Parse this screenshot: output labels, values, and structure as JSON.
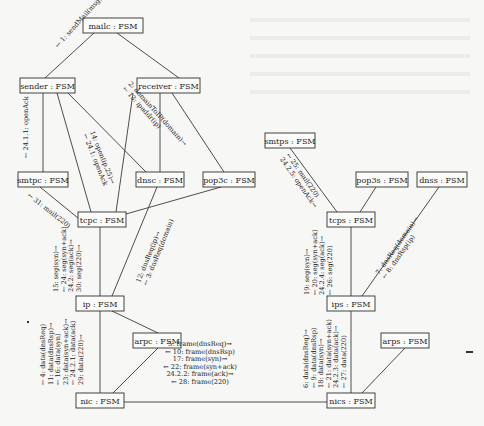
{
  "diagram": {
    "type": "uml-communication-diagram",
    "nodes": [
      {
        "id": "mailc",
        "label": "mailc : FSM",
        "x": 83,
        "y": 18,
        "w": 60,
        "h": 15
      },
      {
        "id": "sender",
        "label": "sender : FSM",
        "x": 20,
        "y": 78,
        "w": 55,
        "h": 15
      },
      {
        "id": "receiver",
        "label": "receiver : FSM",
        "x": 137,
        "y": 78,
        "w": 63,
        "h": 15
      },
      {
        "id": "smtpc",
        "label": "smtpc : FSM",
        "x": 18,
        "y": 172,
        "w": 50,
        "h": 15
      },
      {
        "id": "dnsc",
        "label": "dnsc : FSM",
        "x": 136,
        "y": 172,
        "w": 48,
        "h": 15
      },
      {
        "id": "pop3c",
        "label": "pop3c : FSM",
        "x": 203,
        "y": 172,
        "w": 52,
        "h": 15
      },
      {
        "id": "tcpc",
        "label": "tcpc : FSM",
        "x": 78,
        "y": 212,
        "w": 48,
        "h": 15
      },
      {
        "id": "ip",
        "label": "ip : FSM",
        "x": 76,
        "y": 296,
        "w": 48,
        "h": 15
      },
      {
        "id": "arpc",
        "label": "arpc : FSM",
        "x": 133,
        "y": 333,
        "w": 48,
        "h": 15
      },
      {
        "id": "nic",
        "label": "nic : FSM",
        "x": 76,
        "y": 393,
        "w": 48,
        "h": 15
      },
      {
        "id": "smtps",
        "label": "smtps : FSM",
        "x": 265,
        "y": 133,
        "w": 50,
        "h": 15
      },
      {
        "id": "pop3s",
        "label": "pop3s : FSM",
        "x": 356,
        "y": 172,
        "w": 52,
        "h": 15
      },
      {
        "id": "dnss",
        "label": "dnss : FSM",
        "x": 417,
        "y": 172,
        "w": 50,
        "h": 15
      },
      {
        "id": "tcps",
        "label": "tcps : FSM",
        "x": 327,
        "y": 212,
        "w": 48,
        "h": 15
      },
      {
        "id": "ips",
        "label": "ips : FSM",
        "x": 327,
        "y": 296,
        "w": 48,
        "h": 15
      },
      {
        "id": "arps",
        "label": "arps : FSM",
        "x": 381,
        "y": 333,
        "w": 48,
        "h": 15
      },
      {
        "id": "nics",
        "label": "nics : FSM",
        "x": 327,
        "y": 393,
        "w": 48,
        "h": 15
      }
    ],
    "edges": [
      {
        "from": "mailc",
        "to": "sender",
        "x1": 94,
        "y1": 33,
        "x2": 45,
        "y2": 78
      },
      {
        "from": "mailc",
        "to": "receiver",
        "x1": 117,
        "y1": 33,
        "x2": 179,
        "y2": 78
      },
      {
        "from": "sender",
        "to": "smtpc",
        "x1": 43,
        "y1": 93,
        "x2": 43,
        "y2": 172
      },
      {
        "from": "sender",
        "to": "tcpc",
        "x1": 57,
        "y1": 93,
        "x2": 91,
        "y2": 212
      },
      {
        "from": "sender",
        "to": "dnsc",
        "x1": 68,
        "y1": 93,
        "x2": 146,
        "y2": 172
      },
      {
        "from": "receiver",
        "to": "tcpc",
        "x1": 133,
        "y1": 93,
        "x2": 116,
        "y2": 212
      },
      {
        "from": "receiver",
        "to": "dnsc",
        "x1": 160,
        "y1": 93,
        "x2": 160,
        "y2": 172
      },
      {
        "from": "receiver",
        "to": "pop3c",
        "x1": 172,
        "y1": 93,
        "x2": 224,
        "y2": 172
      },
      {
        "from": "smtpc",
        "to": "tcpc",
        "x1": 40,
        "y1": 187,
        "x2": 78,
        "y2": 218
      },
      {
        "from": "pop3c",
        "to": "tcpc",
        "x1": 221,
        "y1": 187,
        "x2": 126,
        "y2": 214
      },
      {
        "from": "dnsc",
        "to": "ip",
        "x1": 157,
        "y1": 187,
        "x2": 112,
        "y2": 296
      },
      {
        "from": "tcpc",
        "to": "ip",
        "x1": 100,
        "y1": 227,
        "x2": 100,
        "y2": 296
      },
      {
        "from": "ip",
        "to": "arpc",
        "x1": 112,
        "y1": 311,
        "x2": 158,
        "y2": 333
      },
      {
        "from": "ip",
        "to": "nic",
        "x1": 100,
        "y1": 311,
        "x2": 100,
        "y2": 393
      },
      {
        "from": "arpc",
        "to": "nic",
        "x1": 158,
        "y1": 348,
        "x2": 113,
        "y2": 393
      },
      {
        "from": "nic",
        "to": "nics",
        "x1": 124,
        "y1": 402,
        "x2": 327,
        "y2": 402
      },
      {
        "from": "smtps",
        "to": "tcps",
        "x1": 290,
        "y1": 148,
        "x2": 337,
        "y2": 212
      },
      {
        "from": "pop3s",
        "to": "tcps",
        "x1": 376,
        "y1": 187,
        "x2": 360,
        "y2": 212
      },
      {
        "from": "dnss",
        "to": "ips",
        "x1": 439,
        "y1": 187,
        "x2": 362,
        "y2": 296
      },
      {
        "from": "tcps",
        "to": "ips",
        "x1": 351,
        "y1": 227,
        "x2": 351,
        "y2": 296
      },
      {
        "from": "ips",
        "to": "nics",
        "x1": 351,
        "y1": 311,
        "x2": 351,
        "y2": 393
      },
      {
        "from": "arps",
        "to": "nics",
        "x1": 405,
        "y1": 348,
        "x2": 362,
        "y2": 393
      }
    ],
    "messages": [
      {
        "id": "m-mailc-sender",
        "x": 58,
        "y": 48,
        "angle": -48,
        "lines": [
          "← 1: sendMail(msg)"
        ]
      },
      {
        "id": "m-sender-dnsc",
        "x": 128,
        "y": 84,
        "angle": 48,
        "lines": [
          "2: domainToIP(domain)→",
          "← 13: ipaddr(ip)"
        ]
      },
      {
        "id": "m-sender-tcpc",
        "x": 90,
        "y": 132,
        "angle": 68,
        "lines": [
          "14: open(ip,25)→",
          "← 24.1: openAck"
        ]
      },
      {
        "id": "m-sender-smtpc",
        "x": 28,
        "y": 158,
        "angle": -90,
        "lines": [
          "← 24.1.1: openAck"
        ]
      },
      {
        "id": "m-smtpc-tcpc",
        "x": 27,
        "y": 196,
        "angle": 38,
        "lines": [
          "← 31: mail(220)"
        ]
      },
      {
        "id": "m-tcpc-ip",
        "x": 58,
        "y": 292,
        "angle": -90,
        "lines": [
          "15: seg(syn)→",
          "← 24: seg(syn+ack)",
          "24.2: seg(ack)→",
          "30: seg(220)→"
        ]
      },
      {
        "id": "m-dnsc-ip",
        "x": 140,
        "y": 283,
        "angle": -68,
        "lines": [
          "12: dnsReq(ip)→",
          "← 3: dnsReq(domain)"
        ]
      },
      {
        "id": "m-ip-nic",
        "x": 45,
        "y": 385,
        "angle": -90,
        "lines": [
          "← 4: data(dnsReq)",
          "11: data(dnsRsp)→",
          "← 16: data(syn)",
          "23: data(syn+ack)→",
          "← 24.2.1: data(ack)",
          "29: data(220)→"
        ]
      },
      {
        "id": "m-nic-nics",
        "x": 200,
        "y": 346,
        "angle": 0,
        "center": true,
        "lines": [
          "5: frame(dnsReq)→",
          "← 10: frame(dnsRsp)",
          "17: frame(syn)→",
          "← 22: frame(syn+ack)",
          "24.2.2: frame(ack)→",
          "← 28: frame(220)"
        ]
      },
      {
        "id": "m-smtps-tcps",
        "x": 286,
        "y": 155,
        "angle": 55,
        "lines": [
          "← 25: mail(220)",
          "24.2.5: openAck→"
        ]
      },
      {
        "id": "m-tcps-ips",
        "x": 309,
        "y": 295,
        "angle": -90,
        "lines": [
          "19: seg(syn)→",
          "← 20: seg(syn+ack)",
          "24.2.4: seg(ack)→",
          "← 26: seg(220)"
        ]
      },
      {
        "id": "m-dnss-ips",
        "x": 379,
        "y": 275,
        "angle": -55,
        "lines": [
          "7: dnsReq(domain)→",
          "← 8: dnsRsp(ip)"
        ]
      },
      {
        "id": "m-ips-nics",
        "x": 308,
        "y": 388,
        "angle": -90,
        "lines": [
          "6: data(dnsReq)→",
          "← 9: data(dnsRsp)",
          "18: data(syn)→",
          "← 21: data(syn+ack)",
          "24.2.3: data(ack)→",
          "← 27: data(220)"
        ]
      }
    ]
  }
}
